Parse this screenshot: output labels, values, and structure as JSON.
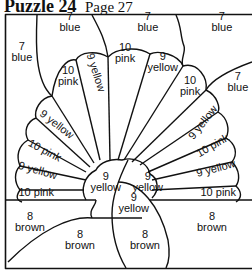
{
  "header": {
    "puzzle": "Puzzle 24",
    "page": "Page 27"
  },
  "regions": [
    {
      "num": "7",
      "color": "blue",
      "x": 70,
      "y": 22,
      "rot": 0,
      "stack": true
    },
    {
      "num": "7",
      "color": "blue",
      "x": 148,
      "y": 22,
      "rot": 0,
      "stack": true
    },
    {
      "num": "7",
      "color": "blue",
      "x": 222,
      "y": 22,
      "rot": 0,
      "stack": true
    },
    {
      "num": "7",
      "color": "blue",
      "x": 22,
      "y": 52,
      "rot": 0,
      "stack": true
    },
    {
      "num": "7",
      "color": "blue",
      "x": 238,
      "y": 82,
      "rot": 0,
      "stack": true
    },
    {
      "num": "10",
      "color": "pink",
      "x": 68,
      "y": 76,
      "rot": 0,
      "stack": true
    },
    {
      "num": "9",
      "color": "yellow",
      "x": 96,
      "y": 72,
      "rot": 72,
      "stack": false
    },
    {
      "num": "10",
      "color": "pink",
      "x": 125,
      "y": 53,
      "rot": 0,
      "stack": true
    },
    {
      "num": "9",
      "color": "yellow",
      "x": 163,
      "y": 62,
      "rot": 0,
      "stack": true
    },
    {
      "num": "10",
      "color": "pink",
      "x": 190,
      "y": 86,
      "rot": 0,
      "stack": true
    },
    {
      "num": "9",
      "color": "yellow",
      "x": 57,
      "y": 124,
      "rot": 38,
      "stack": false
    },
    {
      "num": "10",
      "color": "pink",
      "x": 44,
      "y": 150,
      "rot": 28,
      "stack": false
    },
    {
      "num": "9",
      "color": "yellow",
      "x": 38,
      "y": 170,
      "rot": 16,
      "stack": false
    },
    {
      "num": "10",
      "color": "pink",
      "x": 36,
      "y": 192,
      "rot": 0,
      "stack": false
    },
    {
      "num": "9",
      "color": "yellow",
      "x": 203,
      "y": 122,
      "rot": -52,
      "stack": false
    },
    {
      "num": "10",
      "color": "pink",
      "x": 212,
      "y": 145,
      "rot": -30,
      "stack": false
    },
    {
      "num": "9",
      "color": "yellow",
      "x": 216,
      "y": 168,
      "rot": -15,
      "stack": false
    },
    {
      "num": "10",
      "color": "pink",
      "x": 218,
      "y": 192,
      "rot": 0,
      "stack": false
    },
    {
      "num": "9",
      "color": "yellow",
      "x": 106,
      "y": 182,
      "rot": 0,
      "stack": true
    },
    {
      "num": "9",
      "color": "yellow",
      "x": 148,
      "y": 182,
      "rot": 0,
      "stack": true
    },
    {
      "num": "9",
      "color": "yellow",
      "x": 134,
      "y": 203,
      "rot": 0,
      "stack": true
    },
    {
      "num": "8",
      "color": "brown",
      "x": 30,
      "y": 222,
      "rot": 0,
      "stack": true
    },
    {
      "num": "8",
      "color": "brown",
      "x": 80,
      "y": 240,
      "rot": 0,
      "stack": true
    },
    {
      "num": "8",
      "color": "brown",
      "x": 145,
      "y": 240,
      "rot": 0,
      "stack": true
    },
    {
      "num": "8",
      "color": "brown",
      "x": 212,
      "y": 222,
      "rot": 0,
      "stack": true
    }
  ]
}
